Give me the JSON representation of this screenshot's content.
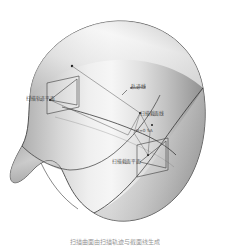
{
  "figure": {
    "caption": "扫描曲面由扫描轨迹与截面线生成",
    "background_color": "#ffffff",
    "line_color": "#333333",
    "surface_light": "#f2f2f2",
    "surface_mid": "#c8c8c8",
    "surface_dark": "#8f8f8f"
  },
  "labels": {
    "sweep_plane_left": "扫描轨迹平面",
    "trajectory_line": "轨迹线",
    "section_line": "扫描截面线",
    "dimension_note": "H=0  SA",
    "sweep_plane_right": "扫描截面平面"
  },
  "geometry": {
    "solid_name": "swept-surface-solid",
    "left_plane_name": "sweep-trajectory-plane",
    "right_plane_name": "sweep-section-plane",
    "trajectory_curve_name": "trajectory-curve",
    "leader_count": 5
  }
}
